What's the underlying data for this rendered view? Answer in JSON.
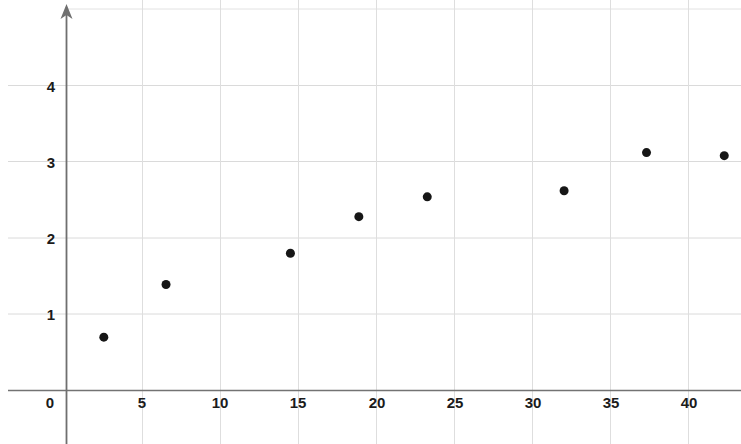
{
  "chart_data": {
    "type": "scatter",
    "title": "",
    "subtitle": "",
    "xlabel": "",
    "ylabel": "",
    "xlim": [
      0,
      43.4
    ],
    "ylim": [
      0,
      5.0
    ],
    "grid": true,
    "legend": null,
    "x_ticks": [
      0,
      5,
      10,
      15,
      20,
      25,
      30,
      35,
      40
    ],
    "x_tick_labels": [
      "0",
      "5",
      "10",
      "15",
      "20",
      "25",
      "30",
      "35",
      "40"
    ],
    "y_ticks": [
      1,
      2,
      3,
      4
    ],
    "y_tick_labels": [
      "1",
      "2",
      "3",
      "4"
    ],
    "x": [
      2.4,
      6.4,
      14.4,
      18.8,
      23.2,
      32.0,
      37.3,
      42.3
    ],
    "y": [
      0.7,
      1.39,
      1.8,
      2.28,
      2.54,
      2.62,
      3.12,
      3.08
    ],
    "points": [
      {
        "x": 2.4,
        "y": 0.7
      },
      {
        "x": 6.4,
        "y": 1.39
      },
      {
        "x": 14.4,
        "y": 1.8
      },
      {
        "x": 18.8,
        "y": 2.28
      },
      {
        "x": 23.2,
        "y": 2.54
      },
      {
        "x": 32.0,
        "y": 2.62
      },
      {
        "x": 37.3,
        "y": 3.12
      },
      {
        "x": 42.3,
        "y": 3.08
      }
    ],
    "marker": {
      "shape": "circle",
      "color": "#161616",
      "size": 9
    },
    "axis_color": "#6b6b6b",
    "grid_color": "#d9d9d9",
    "y_axis_arrow": true,
    "background_color": "#ffffff"
  }
}
